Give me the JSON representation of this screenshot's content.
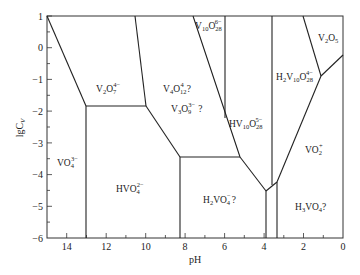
{
  "diagram": {
    "type": "predominance-diagram",
    "xlabel": "pH",
    "ylabel": "lgC",
    "ylabel_sub": "V",
    "xlim": [
      15,
      0
    ],
    "ylim": [
      -6,
      1
    ],
    "x_ticks": [
      "14",
      "12",
      "10",
      "8",
      "6",
      "4",
      "2",
      "0"
    ],
    "y_ticks": [
      "1",
      "0",
      "−1",
      "−2",
      "−3",
      "−4",
      "−5",
      "−6"
    ],
    "species": [
      {
        "base": "V",
        "sub1": "2",
        "mid": "O",
        "sub2": "7",
        "sup": "4−",
        "suffix": ""
      },
      {
        "base": "V",
        "sub1": "4",
        "mid": "O",
        "sub2": "12",
        "sup": "4−",
        "suffix": " ?"
      },
      {
        "base": "V",
        "sub1": "3",
        "mid": "O",
        "sub2": "9",
        "sup": "3−",
        "suffix": " ?"
      },
      {
        "base": "V",
        "sub1": "10",
        "mid": "O",
        "sub2": "28",
        "sup": "6−",
        "suffix": ""
      },
      {
        "base": "V",
        "sub1": "2",
        "mid": "O",
        "sub2": "5",
        "sup": "",
        "suffix": ""
      },
      {
        "base": "H",
        "sub1": "2",
        "mid": "V",
        "sub2": "10",
        "mid2": "O",
        "sub3": "28",
        "sup": "4−",
        "suffix": ""
      },
      {
        "base": "HV",
        "sub1": "10",
        "mid": "O",
        "sub2": "28",
        "sup": "5−",
        "suffix": ""
      },
      {
        "base": "VO",
        "sub1": "4",
        "mid": "",
        "sub2": "",
        "sup": "3−",
        "suffix": ""
      },
      {
        "base": "HVO",
        "sub1": "4",
        "mid": "",
        "sub2": "",
        "sup": "2−",
        "suffix": ""
      },
      {
        "base": "H",
        "sub1": "2",
        "mid": "VO",
        "sub2": "4",
        "sup": "−",
        "suffix": "?"
      },
      {
        "base": "VO",
        "sub1": "2",
        "mid": "",
        "sub2": "",
        "sup": "+",
        "suffix": ""
      },
      {
        "base": "H",
        "sub1": "3",
        "mid": "VO",
        "sub2": "4",
        "sup": "",
        "suffix": "?"
      }
    ],
    "labels": {
      "v2o7": "V2O7 4-",
      "v4o12": "V4O12 4- ?",
      "v3o9": "V3O9 3- ?",
      "v10o28": "V10O28 6-",
      "v2o5": "V2O5",
      "h2v10o28": "H2V10O28 4-",
      "hv10o28": "HV10O28 5-",
      "vo4": "VO4 3-",
      "hvo4": "HVO4 2-",
      "h2vo4": "H2VO4 - ?",
      "vo2": "VO2 +",
      "h3vo4": "H3VO4?"
    },
    "boundaries_ph_lgc": [
      [
        [
          15,
          1
        ],
        [
          13.1,
          -1.85
        ]
      ],
      [
        [
          13.1,
          -1.85
        ],
        [
          10.05,
          -1.85
        ]
      ],
      [
        [
          10.6,
          1
        ],
        [
          10.05,
          -1.85
        ]
      ],
      [
        [
          13.1,
          -1.85
        ],
        [
          13.1,
          -6
        ]
      ],
      [
        [
          10.05,
          -1.85
        ],
        [
          8.3,
          -3.45
        ]
      ],
      [
        [
          8.3,
          -3.45
        ],
        [
          8.3,
          -6
        ]
      ],
      [
        [
          8.3,
          -3.45
        ],
        [
          5.25,
          -3.45
        ]
      ],
      [
        [
          7.95,
          1
        ],
        [
          5.25,
          -3.45
        ]
      ],
      [
        [
          6.0,
          1
        ],
        [
          6.0,
          -2.2
        ]
      ],
      [
        [
          5.25,
          -3.45
        ],
        [
          3.95,
          -4.5
        ]
      ],
      [
        [
          3.95,
          -4.5
        ],
        [
          3.95,
          -6
        ]
      ],
      [
        [
          3.95,
          -4.5
        ],
        [
          3.4,
          -4.2
        ]
      ],
      [
        [
          3.4,
          -4.2
        ],
        [
          3.4,
          -6
        ]
      ],
      [
        [
          3.65,
          1
        ],
        [
          3.65,
          -4.35
        ]
      ],
      [
        [
          3.4,
          -4.2
        ],
        [
          1.1,
          -0.9
        ]
      ],
      [
        [
          2.05,
          1
        ],
        [
          1.1,
          -0.9
        ]
      ],
      [
        [
          1.1,
          -0.9
        ],
        [
          0,
          -0.25
        ]
      ]
    ]
  }
}
